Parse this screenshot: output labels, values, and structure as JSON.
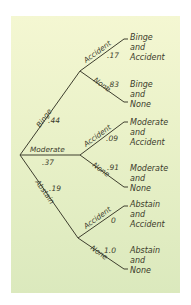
{
  "diagram": {
    "type": "probability-tree",
    "root": {
      "branches": [
        {
          "label": "Binge",
          "prob": ".44",
          "children": [
            {
              "label": "Accident",
              "prob": ".17",
              "outcome": [
                "Binge",
                "and",
                "Accident"
              ]
            },
            {
              "label": "None",
              "prob": ".83",
              "outcome": [
                "Binge",
                "and",
                "None"
              ]
            }
          ]
        },
        {
          "label": "Moderate",
          "prob": ".37",
          "children": [
            {
              "label": "Accident",
              "prob": ".09",
              "outcome": [
                "Moderate",
                "and",
                "Accident"
              ]
            },
            {
              "label": "None",
              "prob": ".91",
              "outcome": [
                "Moderate",
                "and",
                "None"
              ]
            }
          ]
        },
        {
          "label": "Abstain",
          "prob": ".19",
          "children": [
            {
              "label": "Accident",
              "prob": "0",
              "outcome": [
                "Abstain",
                "and",
                "Accident"
              ]
            },
            {
              "label": "None",
              "prob": "1.0",
              "outcome": [
                "Abstain",
                "and",
                "None"
              ]
            }
          ]
        }
      ]
    },
    "colors": {
      "background_top": "#f4f7d2",
      "background_bottom": "#dbe9bd",
      "line": "#3e3e2e",
      "text": "#3a3a2a"
    }
  }
}
